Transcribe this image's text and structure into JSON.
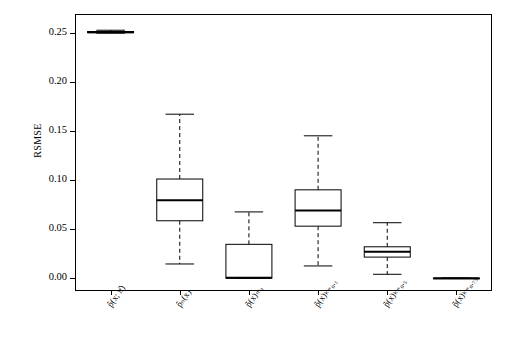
{
  "chart_data": {
    "type": "box",
    "title": "",
    "xlabel": "",
    "ylabel": "RSMSE",
    "ylim": [
      -0.012,
      0.268
    ],
    "yticks": [
      "0.00",
      "0.05",
      "0.10",
      "0.15",
      "0.20",
      "0.25"
    ],
    "ytick_values": [
      0.0,
      0.05,
      0.1,
      0.15,
      0.2,
      0.25
    ],
    "grid": false,
    "legend": "none",
    "categories": [
      "p̂(x; π̂)",
      "p̂ₙ(x)",
      "p̃(x)ₘₐ",
      "p̃(x)ₖ₌₀.₁",
      "p̃(x)ₖ₌₀.₅",
      "p̃(x)ₖ₌₀.₇₅"
    ],
    "categories_plain": [
      "phat(x; pihat)",
      "phat_n(x)",
      "ptilde(x)_ma",
      "ptilde(x)_k=0.1",
      "ptilde(x)_k=0.5",
      "ptilde(x)_k=0.75"
    ],
    "boxes": [
      {
        "label": "p̂(x; π̂)",
        "min": 0.2495,
        "q1": 0.25,
        "median": 0.2505,
        "q3": 0.2512,
        "max": 0.2525
      },
      {
        "label": "p̂ₙ(x)",
        "min": 0.0145,
        "q1": 0.0585,
        "median": 0.0795,
        "q3": 0.101,
        "max": 0.167
      },
      {
        "label": "p̃(x)ₘₐ",
        "min": 0.0,
        "q1": 0.0,
        "median": 0.0005,
        "q3": 0.0345,
        "max": 0.0675
      },
      {
        "label": "p̃(x)ₖ₌₀.₁",
        "min": 0.0125,
        "q1": 0.053,
        "median": 0.069,
        "q3": 0.09,
        "max": 0.145
      },
      {
        "label": "p̃(x)ₖ₌₀.₅",
        "min": 0.004,
        "q1": 0.0215,
        "median": 0.027,
        "q3": 0.032,
        "max": 0.0565
      },
      {
        "label": "p̃(x)ₖ₌₀.₇₅",
        "min": 0.0,
        "q1": 0.0,
        "median": 0.0,
        "q3": 0.0,
        "max": 0.0
      }
    ],
    "colors": {
      "line": "#000000",
      "background": "#ffffff",
      "box_fill": "#ffffff"
    }
  }
}
